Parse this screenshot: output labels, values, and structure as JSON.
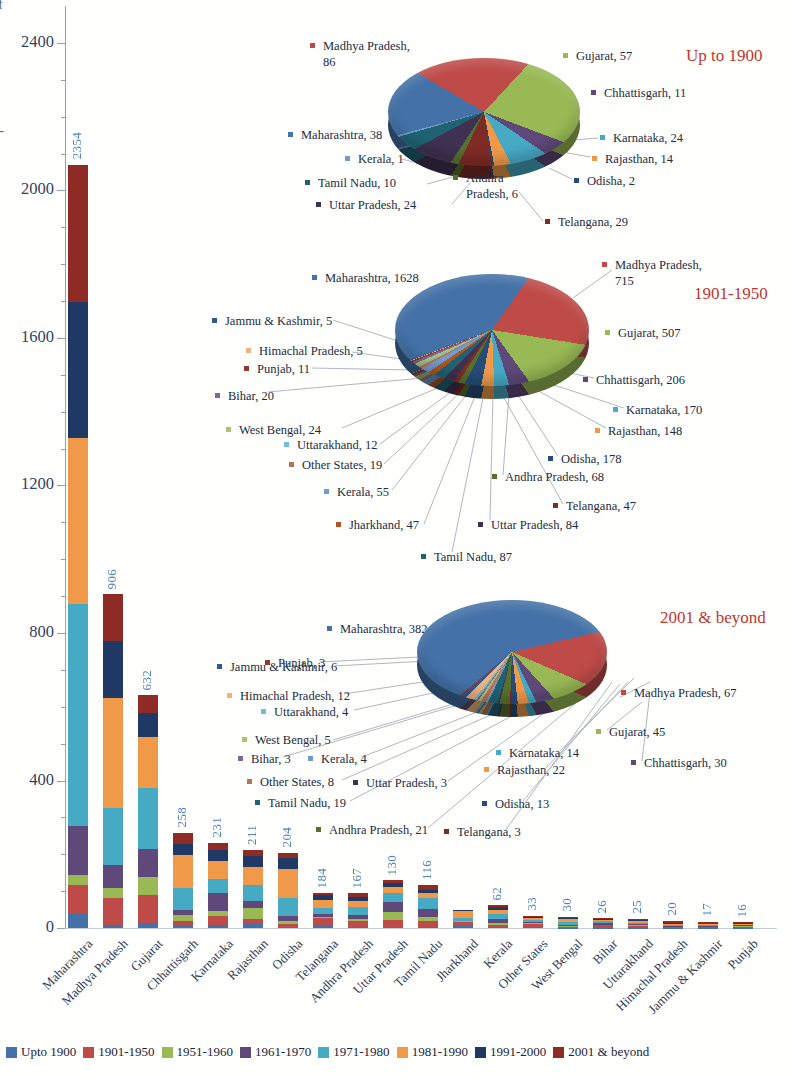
{
  "axis": {
    "y_ticks": [
      {
        "label": "2400",
        "value": 2400
      },
      {
        "label": "2000",
        "value": 2000
      },
      {
        "label": "1600",
        "value": 1600
      },
      {
        "label": "1200",
        "value": 1200
      },
      {
        "label": "800",
        "value": 800
      },
      {
        "label": "400",
        "value": 400
      },
      {
        "label": "0",
        "value": 0
      }
    ],
    "clipped_fragments": [
      "f",
      "-"
    ]
  },
  "legend": {
    "items": [
      {
        "label": "Upto 1900",
        "color": "#4472A8"
      },
      {
        "label": "1901-1950",
        "color": "#BE4B48"
      },
      {
        "label": "1951-1960",
        "color": "#98B954"
      },
      {
        "label": "1961-1970",
        "color": "#5F497A"
      },
      {
        "label": "1971-1980",
        "color": "#46AAC5"
      },
      {
        "label": "1981-1990",
        "color": "#F09A49"
      },
      {
        "label": "1991-2000",
        "color": "#1F3864"
      },
      {
        "label": "2001 & beyond",
        "color": "#8E2B25"
      }
    ]
  },
  "state_colors": {
    "Maharashtra": "#4472A8",
    "Madhya Pradesh": "#BE4B48",
    "Gujarat": "#98B954",
    "Chhattisgarh": "#5F497A",
    "Karnataka": "#46AAC5",
    "Rajasthan": "#F09A49",
    "Odisha": "#264D79",
    "Telangana": "#7E2B26",
    "Andhra Pradesh": "#56702D",
    "Uttar Pradesh": "#3F3151",
    "Tamil Nadu": "#1F6373",
    "Jharkhand": "#B0551F",
    "Kerala": "#729ACA",
    "Other States": "#B97455",
    "West Bengal": "#AEC172",
    "Bihar": "#7D6996",
    "Uttarakhand": "#6FBDD1",
    "Himachal Pradesh": "#F3B079",
    "Jammu & Kashmir": "#2F5B8F",
    "Punjab": "#943634"
  },
  "chart_data": [
    {
      "type": "bar",
      "stacked": true,
      "title": "",
      "xlabel": "",
      "ylabel": "",
      "ylim": [
        0,
        2400
      ],
      "yticks": [
        0,
        400,
        800,
        1200,
        1600,
        2000,
        2400
      ],
      "grid": false,
      "legend_position": "bottom",
      "categories": [
        "Maharashtra",
        "Madhya Pradesh",
        "Gujarat",
        "Chhattisgarh",
        "Karnataka",
        "Rajasthan",
        "Odisha",
        "Telangana",
        "Andhra Pradesh",
        "Uttar Pradesh",
        "Tamil Nadu",
        "Jharkhand",
        "Kerala",
        "Other States",
        "West Bengal",
        "Bihar",
        "Uttarakhand",
        "Himachal Pradesh",
        "Jammu & Kashmir",
        "Punjab"
      ],
      "value_labels": [
        "2354",
        "906",
        "632",
        "258",
        "231",
        "211",
        "204",
        "184",
        "167",
        "130",
        "116",
        "",
        "62",
        "33",
        "30",
        "26",
        "25",
        "20",
        "17",
        "16"
      ],
      "totals_labeled": [
        2354,
        906,
        632,
        258,
        231,
        211,
        204,
        184,
        167,
        130,
        116,
        null,
        62,
        33,
        30,
        26,
        25,
        20,
        17,
        16
      ],
      "series_note": "per-segment values estimated visually from bar pixels",
      "series": [
        {
          "name": "Upto 1900",
          "color": "#4472A8",
          "values_est": [
            38,
            9,
            13,
            5,
            8,
            10,
            4,
            6,
            4,
            4,
            4,
            6,
            2,
            2,
            1,
            1,
            1,
            1,
            1,
            1
          ]
        },
        {
          "name": "1901-1950",
          "color": "#BE4B48",
          "values_est": [
            80,
            72,
            76,
            15,
            25,
            15,
            8,
            20,
            14,
            18,
            16,
            10,
            6,
            8,
            3,
            6,
            4,
            2,
            2,
            3
          ]
        },
        {
          "name": "1951-1960",
          "color": "#98B954",
          "values_est": [
            25,
            27,
            50,
            15,
            12,
            28,
            6,
            5,
            6,
            22,
            10,
            2,
            6,
            3,
            2,
            2,
            2,
            1,
            1,
            1
          ]
        },
        {
          "name": "1961-1970",
          "color": "#5F497A",
          "values_est": [
            135,
            63,
            76,
            15,
            50,
            20,
            14,
            8,
            10,
            26,
            22,
            2,
            10,
            4,
            3,
            4,
            3,
            2,
            2,
            2
          ]
        },
        {
          "name": "1971-1980",
          "color": "#46AAC5",
          "values_est": [
            600,
            154,
            165,
            60,
            38,
            45,
            50,
            15,
            23,
            24,
            30,
            6,
            14,
            6,
            8,
            5,
            5,
            3,
            2,
            2
          ]
        },
        {
          "name": "1981-1990",
          "color": "#F09A49",
          "values_est": [
            450,
            299,
            139,
            88,
            50,
            48,
            78,
            23,
            17,
            16,
            12,
            20,
            12,
            4,
            8,
            3,
            4,
            3,
            2,
            2
          ]
        },
        {
          "name": "1991-2000",
          "color": "#1F3864",
          "values_est": [
            370,
            154,
            63,
            30,
            28,
            30,
            30,
            12,
            10,
            12,
            8,
            2,
            8,
            3,
            3,
            3,
            3,
            2,
            2,
            2
          ]
        },
        {
          "name": "2001 & beyond",
          "color": "#8E2B25",
          "values_est": [
            372,
            128,
            50,
            30,
            20,
            15,
            14,
            6,
            11,
            8,
            14,
            2,
            4,
            3,
            2,
            2,
            3,
            6,
            5,
            3
          ]
        }
      ]
    },
    {
      "type": "pie",
      "title": "Up to 1900",
      "entries": [
        {
          "state": "Maharashtra",
          "value": 38
        },
        {
          "state": "Madhya Pradesh",
          "value": 86
        },
        {
          "state": "Gujarat",
          "value": 57
        },
        {
          "state": "Chhattisgarh",
          "value": 11
        },
        {
          "state": "Karnataka",
          "value": 24
        },
        {
          "state": "Rajasthan",
          "value": 14
        },
        {
          "state": "Odisha",
          "value": 2
        },
        {
          "state": "Telangana",
          "value": 29
        },
        {
          "state": "Andhra Pradesh",
          "value": 6
        },
        {
          "state": "Uttar Pradesh",
          "value": 24
        },
        {
          "state": "Tamil Nadu",
          "value": 10
        },
        {
          "state": "Kerala",
          "value": 1
        }
      ]
    },
    {
      "type": "pie",
      "title": "1901-1950",
      "entries": [
        {
          "state": "Maharashtra",
          "value": 1628
        },
        {
          "state": "Madhya Pradesh",
          "value": 715
        },
        {
          "state": "Gujarat",
          "value": 507
        },
        {
          "state": "Chhattisgarh",
          "value": 206
        },
        {
          "state": "Karnataka",
          "value": 170
        },
        {
          "state": "Rajasthan",
          "value": 148
        },
        {
          "state": "Odisha",
          "value": 178
        },
        {
          "state": "Andhra Pradesh",
          "value": 68
        },
        {
          "state": "Telangana",
          "value": 47
        },
        {
          "state": "Uttar Pradesh",
          "value": 84
        },
        {
          "state": "Tamil Nadu",
          "value": 87
        },
        {
          "state": "Jharkhand",
          "value": 47
        },
        {
          "state": "Kerala",
          "value": 55
        },
        {
          "state": "Other States",
          "value": 19
        },
        {
          "state": "Uttarakhand",
          "value": 12
        },
        {
          "state": "West Bengal",
          "value": 24
        },
        {
          "state": "Bihar",
          "value": 20
        },
        {
          "state": "Punjab",
          "value": 11
        },
        {
          "state": "Himachal Pradesh",
          "value": 5
        },
        {
          "state": "Jammu & Kashmir",
          "value": 5
        }
      ]
    },
    {
      "type": "pie",
      "title": "2001 & beyond",
      "entries": [
        {
          "state": "Maharashtra",
          "value": 382
        },
        {
          "state": "Madhya Pradesh",
          "value": 67
        },
        {
          "state": "Gujarat",
          "value": 45
        },
        {
          "state": "Chhattisgarh",
          "value": 30
        },
        {
          "state": "Karnataka",
          "value": 14
        },
        {
          "state": "Rajasthan",
          "value": 22
        },
        {
          "state": "Odisha",
          "value": 13
        },
        {
          "state": "Telangana",
          "value": 3
        },
        {
          "state": "Andhra Pradesh",
          "value": 21
        },
        {
          "state": "Uttar Pradesh",
          "value": 3
        },
        {
          "state": "Tamil Nadu",
          "value": 19
        },
        {
          "state": "Kerala",
          "value": 4
        },
        {
          "state": "Other States",
          "value": 8
        },
        {
          "state": "West Bengal",
          "value": 5
        },
        {
          "state": "Bihar",
          "value": 3
        },
        {
          "state": "Uttarakhand",
          "value": 4
        },
        {
          "state": "Himachal Pradesh",
          "value": 12
        },
        {
          "state": "Jammu & Kashmir",
          "value": 6
        },
        {
          "state": "Punjab",
          "value": 3
        }
      ]
    }
  ]
}
